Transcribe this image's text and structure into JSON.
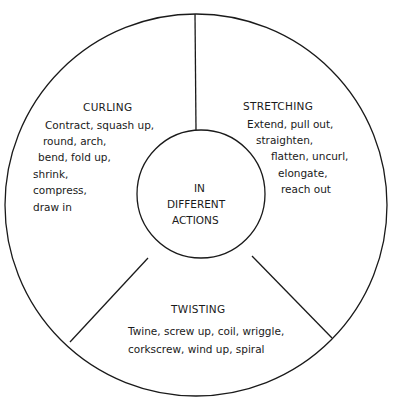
{
  "diagram": {
    "center": {
      "lines": [
        "IN",
        "DIFFERENT",
        "ACTIONS"
      ]
    },
    "segments": [
      {
        "id": "curling",
        "heading": "CURLING",
        "lines": [
          "Contract, squash up,",
          "round, arch,",
          "bend, fold up,",
          "shrink,",
          "compress,",
          "draw in"
        ]
      },
      {
        "id": "stretching",
        "heading": "STRETCHING",
        "lines": [
          "Extend, pull out,",
          "straighten,",
          "flatten, uncurl,",
          "elongate,",
          "reach out"
        ]
      },
      {
        "id": "twisting",
        "heading": "TWISTING",
        "lines": [
          "Twine, screw up, coil, wriggle,",
          "corkscrew, wind up, spiral"
        ]
      }
    ],
    "colors": {
      "stroke": "#1a1a1a",
      "background": "#ffffff"
    }
  }
}
